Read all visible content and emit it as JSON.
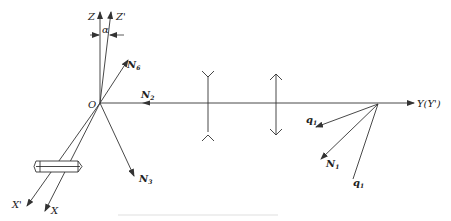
{
  "diagram": {
    "origin_label": "O",
    "axes": {
      "z": "Z",
      "z_prime": "Z'",
      "y": "Y(Y')",
      "x": "X",
      "x_prime": "X'"
    },
    "angle_label": "α",
    "vectors": {
      "n6": {
        "main": "N",
        "sub": "6"
      },
      "n2": {
        "main": "N",
        "sub": "2"
      },
      "n3": {
        "main": "N",
        "sub": "3"
      },
      "n1": {
        "main": "N",
        "sub": "1"
      },
      "q1_upper": {
        "main": "q",
        "sub": "1"
      },
      "q1_lower": {
        "main": "q",
        "sub": "1"
      }
    },
    "elements": [
      "crystal-prism",
      "diverging-lens",
      "converging-lens"
    ],
    "colors": {
      "line": "#333333",
      "background": "#ffffff"
    }
  }
}
